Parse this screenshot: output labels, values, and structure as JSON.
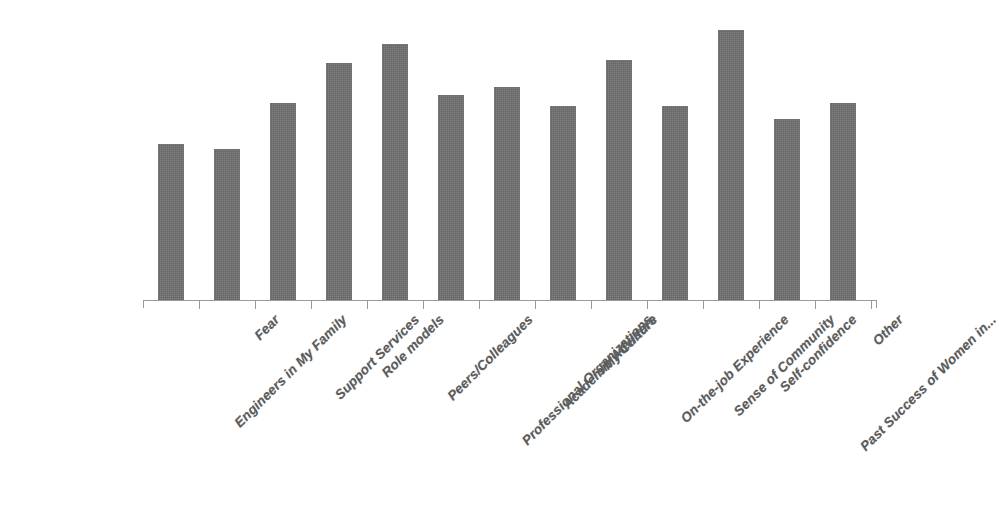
{
  "chart_data": {
    "type": "bar",
    "title": "",
    "subtitle": "",
    "xlabel": "",
    "ylabel": "",
    "ylim": [
      0,
      100
    ],
    "grid": false,
    "legend": false,
    "legend_position": "none",
    "axis": {
      "y_axis_visible": false,
      "y_tick_labels": [],
      "x_axis_visible": true,
      "x_tick_marks": 14,
      "x_label_rotation_degrees": -45
    },
    "colors": {
      "bar": "#6f6f6f",
      "axis": "#9a9a9a",
      "label_text": "#5b5b5b",
      "background": "#ffffff"
    },
    "categories": [
      "Engineers in My Family",
      "Fear",
      "Support Services",
      "Role models",
      "Peers/Colleagues",
      "Professional Organizations",
      "Academic Advisers",
      "My Culture",
      "On-the-job Experience",
      "Sense of Community",
      "Self-confidence",
      "Past Success of Women in...",
      "Other"
    ],
    "values": [
      58,
      56,
      73,
      88,
      95,
      76,
      79,
      72,
      89,
      72,
      100,
      67,
      73
    ],
    "bars": [
      {
        "label": "Engineers in My Family",
        "value": 58
      },
      {
        "label": "Fear",
        "value": 56
      },
      {
        "label": "Support Services",
        "value": 73
      },
      {
        "label": "Role models",
        "value": 88
      },
      {
        "label": "Peers/Colleagues",
        "value": 95
      },
      {
        "label": "Professional Organizations",
        "value": 76
      },
      {
        "label": "Academic Advisers",
        "value": 79
      },
      {
        "label": "My Culture",
        "value": 72
      },
      {
        "label": "On-the-job Experience",
        "value": 89
      },
      {
        "label": "Sense of Community",
        "value": 72
      },
      {
        "label": "Self-confidence",
        "value": 100
      },
      {
        "label": "Past Success of Women in...",
        "value": 67
      },
      {
        "label": "Other",
        "value": 73
      }
    ]
  }
}
